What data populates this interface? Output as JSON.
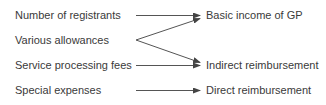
{
  "diagram": {
    "sources": [
      {
        "id": "registrants",
        "label": "Number of registrants"
      },
      {
        "id": "allowances",
        "label": "Various allowances"
      },
      {
        "id": "service_fees",
        "label": "Service processing fees"
      },
      {
        "id": "special_expenses",
        "label": "Special expenses"
      }
    ],
    "targets": [
      {
        "id": "basic_income",
        "label": "Basic income of GP"
      },
      {
        "id": "indirect",
        "label": "Indirect reimbursement"
      },
      {
        "id": "direct",
        "label": "Direct reimbursement"
      }
    ],
    "edges": [
      {
        "from": "registrants",
        "to": "basic_income"
      },
      {
        "from": "allowances",
        "to": "basic_income"
      },
      {
        "from": "allowances",
        "to": "indirect"
      },
      {
        "from": "service_fees",
        "to": "indirect"
      },
      {
        "from": "special_expenses",
        "to": "direct"
      }
    ],
    "colors": {
      "text": "#3a3a3a",
      "line": "#555555",
      "background": "#ffffff"
    }
  }
}
